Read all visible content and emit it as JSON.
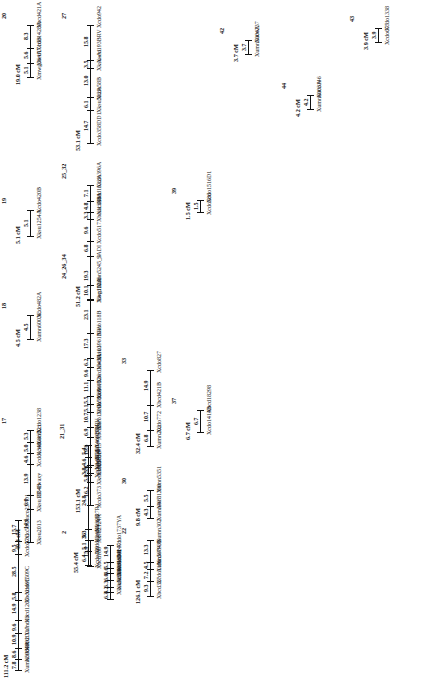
{
  "figure": {
    "type": "genetic-linkage-map",
    "units": "cM",
    "orientation": "rotated-90"
  },
  "linkage_groups": [
    {
      "name": "20",
      "total": "19.0 cM",
      "markers": [
        "Xbcd421A",
        "Xcdo1428A",
        "Xbcd1716B",
        "Xmwg364A"
      ],
      "distances": [
        "8.3",
        "5.6",
        "5.1"
      ]
    },
    {
      "name": "19",
      "total": "5.1 cM",
      "markers": [
        "Xcdo420B",
        "Xksu1254A"
      ],
      "distances": [
        "5.1"
      ]
    },
    {
      "name": "18",
      "total": "4.5 cM",
      "markers": [
        "Xcdo482A",
        "Xumn6003C"
      ],
      "distances": [
        "4.5"
      ]
    },
    {
      "name": "17",
      "total": "49.4 cM",
      "markers": [
        "Xcdo1238",
        "Xacr221",
        "Xcdo686B",
        "Xcdo1340",
        "PR-1waxy",
        "Xksu1254B",
        "Xksu2013"
      ],
      "distances": [
        "5.3",
        "5.0",
        "4.6",
        "13.9",
        "6.0",
        "14.6"
      ]
    },
    {
      "name": "27",
      "total": "53.1 cM",
      "markers": [
        "Xcdo942",
        "Xaco193BRV",
        "Xksu-A1",
        "Xcdo58B",
        "Xksu582A",
        "Xcdo358DD1"
      ],
      "distances": [
        "15.8",
        "3.5",
        "13.0",
        "6.1",
        "14.7"
      ]
    },
    {
      "name": "25_32",
      "total": "51.2 cM",
      "markers": [
        "Xcdo396A",
        "Xbcd1632A",
        "Xaco181",
        "Xbcd1338A",
        "Xcdo517",
        "SADI",
        "Xbcd1235"
      ],
      "distances": [
        "7.1",
        "4.8",
        "3.3",
        "9.6",
        "6.8",
        "19.3"
      ]
    },
    {
      "name": "24_26_34",
      "total": "153.1 cM",
      "markers": [
        "Xumn5245_3",
        "Xwg110A",
        "Xaco118B",
        "Xksu1961BRV",
        "Xbcd1103",
        "Xbcd1643A",
        "Xcdo1326",
        "Xcdo690A",
        "Xcdo795A",
        "Xaco139RV",
        "Xbcd897",
        "Xbcd1413",
        "Xksu563B",
        "Xksu1651",
        "Xcdo373"
      ],
      "distances": [
        "10.1",
        "23.1",
        "17.3",
        "6.2",
        "9.6",
        "11.1",
        "5.5",
        "5.1",
        "10.7",
        "6.9",
        "19.6",
        "5.8",
        "5.8",
        "16.2"
      ]
    },
    {
      "name": "21_31",
      "total": "55.4 cM",
      "markers": [
        "Xaco190RV",
        "Xcdo1469BD1",
        "Xbcd1250",
        "Xcdo1407A",
        "Xaco127R1",
        "Xbcd1230B",
        "Xcdo1246A",
        "Xcdo189"
      ],
      "distances": [
        "5.4",
        "4.6",
        "3.8",
        "24.8",
        "5.3",
        "5.1",
        "6.4"
      ]
    },
    {
      "name": "33",
      "total": "32.4 cM",
      "markers": [
        "Xcdo827",
        "Xbcd421B",
        "Xcdo772",
        "Xumn202"
      ],
      "distances": [
        "14.9",
        "10.7",
        "6.8"
      ]
    },
    {
      "name": "30",
      "total": "9.8 cM",
      "markers": [
        "Xumn5351",
        "Xbcd1390",
        "Xumn407"
      ],
      "distances": [
        "5.5",
        "4.3"
      ]
    },
    {
      "name": "37",
      "total": "6.7 cM",
      "markers": [
        "Xbcd18298",
        "Xcdo1414B"
      ],
      "distances": [
        "6.7"
      ]
    },
    {
      "name": "39",
      "total": "1.5 cM",
      "markers": [
        "Xcdo1516D1",
        "Xcdo586"
      ],
      "distances": [
        "1.5"
      ]
    },
    {
      "name": "42",
      "total": "3.7 cM",
      "markers": [
        "Xaco237",
        "Xumn5004A"
      ],
      "distances": [
        "3.7"
      ]
    },
    {
      "name": "44",
      "total": "4.2 cM",
      "markers": [
        "Xaco146",
        "Xumn6003A"
      ],
      "distances": [
        "4.2"
      ]
    },
    {
      "name": "43",
      "total": "3.9 cM",
      "markers": [
        "Xcdo1338",
        "Xcdo677"
      ],
      "distances": [
        "3.9"
      ]
    },
    {
      "name": "22",
      "total": "126.1 cM",
      "markers": [
        "Xumn302",
        "Xcdo793B",
        "Xumn5084A",
        "Xcdo1196",
        "Xbcd327"
      ],
      "distances": [
        "13.3",
        "4.5",
        "7.2",
        "9.3"
      ]
    },
    {
      "name": "16_23",
      "total": "111.2 cM",
      "markers": [
        "Xaco237D1",
        "Xcdo58C",
        "Xcdo57C",
        "Xcdo1509C",
        "Xbcd1695",
        "Xbcd1265",
        "Xumn13",
        "Xbcd1117",
        "Xcdo1092",
        "Xumn5984A"
      ],
      "distances": [
        "15.7",
        "9.5",
        "28.5",
        "5.8",
        "14.9",
        "9.6",
        "10.9",
        "8.6",
        "7.8"
      ]
    },
    {
      "name": "2",
      "total": "",
      "markers": [
        "Xksu2124A",
        "Xbcd180"
      ],
      "distances": [
        "15.9"
      ]
    },
    {
      "name": "36",
      "total": "",
      "markers": [
        "Xcdo1737YA",
        "Xcdo1471",
        "Xcdo542",
        "Xaco168A",
        "Xcdo6003DH",
        "Xksu5898",
        "Xksu503A"
      ],
      "distances": [
        "14.9",
        "5.5",
        "4.6",
        "6.0",
        "6.3",
        "4.2",
        "6.3"
      ]
    }
  ]
}
